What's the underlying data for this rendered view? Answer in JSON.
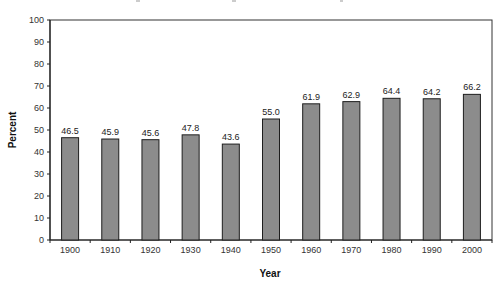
{
  "chart_data": {
    "type": "bar",
    "title": "",
    "xlabel": "Year",
    "ylabel": "Percent",
    "categories": [
      "1900",
      "1910",
      "1920",
      "1930",
      "1940",
      "1950",
      "1960",
      "1970",
      "1980",
      "1990",
      "2000"
    ],
    "values": [
      46.5,
      45.9,
      45.6,
      47.8,
      43.6,
      55.0,
      61.9,
      62.9,
      64.4,
      64.2,
      66.2
    ],
    "value_labels": [
      "46.5",
      "45.9",
      "45.6",
      "47.8",
      "43.6",
      "55.0",
      "61.9",
      "62.9",
      "64.4",
      "64.2",
      "66.2"
    ],
    "ylim": [
      0,
      100
    ],
    "yticks": [
      0,
      10,
      20,
      30,
      40,
      50,
      60,
      70,
      80,
      90,
      100
    ],
    "grid": false,
    "legend": null,
    "colors": {
      "bar_fill": "#8c8c8c",
      "bar_stroke": "#1e1e1e",
      "axis": "#222222",
      "frame": "#333333"
    }
  }
}
